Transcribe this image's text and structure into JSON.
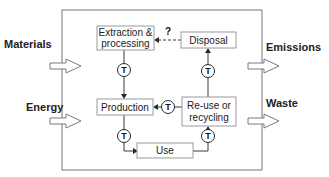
{
  "diagram": {
    "type": "material-lifecycle",
    "system_boundary": "system-boundary",
    "inputs": [
      {
        "id": "materials",
        "label": "Materials"
      },
      {
        "id": "energy",
        "label": "Energy"
      }
    ],
    "outputs": [
      {
        "id": "emissions",
        "label": "Emissions"
      },
      {
        "id": "waste",
        "label": "Waste"
      }
    ],
    "nodes": {
      "extraction": {
        "lines": [
          "Extraction &",
          "processing"
        ]
      },
      "disposal": {
        "lines": [
          "Disposal"
        ]
      },
      "production": {
        "lines": [
          "Production"
        ]
      },
      "reuse": {
        "lines": [
          "Re-use or",
          "recycling"
        ]
      },
      "use": {
        "lines": [
          "Use"
        ]
      }
    },
    "transport_symbol": "T",
    "unknown_link_label": "?",
    "edges": [
      {
        "from": "extraction",
        "to": "production",
        "via": "T"
      },
      {
        "from": "production",
        "to": "use",
        "via": "T"
      },
      {
        "from": "use",
        "to": "reuse",
        "via": "T"
      },
      {
        "from": "reuse",
        "to": "production",
        "via": "T"
      },
      {
        "from": "reuse",
        "to": "disposal",
        "via": "T"
      },
      {
        "from": "disposal",
        "to": "extraction",
        "style": "dashed",
        "label": "?"
      }
    ]
  }
}
